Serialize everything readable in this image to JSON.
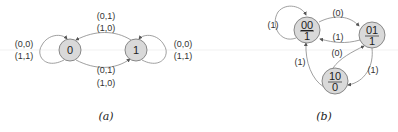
{
  "diagram_a": {
    "caption": "(a)",
    "nodes": [
      {
        "id": "0",
        "label": "0"
      },
      {
        "id": "1",
        "label": "1"
      }
    ],
    "edges": {
      "top_0_from_1": {
        "line1": "(0,1)",
        "line2": "(1,0)"
      },
      "bottom_1_from_0": {
        "line1": "(0,1)",
        "line2": "(1,0)"
      },
      "self_loop_0": {
        "line1": "(0,0)",
        "line2": "(1,1)"
      },
      "self_loop_1": {
        "line1": "(0,0)",
        "line2": "(1,1)"
      }
    }
  },
  "diagram_b": {
    "caption": "(b)",
    "nodes": [
      {
        "id": "00",
        "state": "00",
        "output": "1"
      },
      {
        "id": "01",
        "state": "01",
        "output": "1"
      },
      {
        "id": "10",
        "state": "10",
        "output": "0"
      }
    ],
    "edges": {
      "self_loop_00": "(1)",
      "00_to_01": "(0)",
      "01_to_00": "(1)",
      "10_to_01": "(0)",
      "10_to_00": "(1)",
      "01_to_10": "(1)"
    }
  }
}
